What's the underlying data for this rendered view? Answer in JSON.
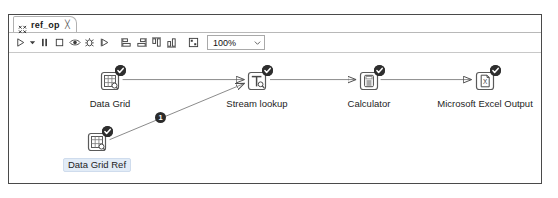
{
  "window": {
    "tab": {
      "label": "ref_op",
      "icon": "transformation-icon",
      "close": "╳"
    }
  },
  "toolbar": {
    "buttons": [
      {
        "name": "run-button",
        "icon": "play-icon",
        "label": "Run"
      },
      {
        "name": "run-options-caret",
        "icon": "caret-down-icon",
        "label": "Run options"
      },
      {
        "name": "pause-button",
        "icon": "pause-icon",
        "label": "Pause"
      },
      {
        "name": "stop-button",
        "icon": "stop-icon",
        "label": "Stop"
      },
      {
        "name": "preview-button",
        "icon": "eye-icon",
        "label": "Preview"
      },
      {
        "name": "debug-button",
        "icon": "bug-icon",
        "label": "Debug"
      },
      {
        "name": "replay-button",
        "icon": "replay-icon",
        "label": "Replay"
      },
      {
        "name": "align-left-button",
        "icon": "align-left-icon",
        "label": "Align left"
      },
      {
        "name": "align-right-button",
        "icon": "align-right-icon",
        "label": "Align right"
      },
      {
        "name": "align-top-button",
        "icon": "align-top-icon",
        "label": "Align top"
      },
      {
        "name": "align-bottom-button",
        "icon": "align-bottom-icon",
        "label": "Align bottom"
      },
      {
        "name": "snap-to-grid-button",
        "icon": "grid-snap-icon",
        "label": "Snap to grid"
      }
    ],
    "zoom": {
      "value": "100%",
      "options": [
        "200%",
        "150%",
        "100%",
        "75%",
        "50%",
        "25%"
      ]
    }
  },
  "canvas": {
    "nodes": [
      {
        "id": "data-grid",
        "label": "Data Grid",
        "icon": "data-grid-icon",
        "x": 101,
        "y": 26,
        "status": "ok",
        "selected": false
      },
      {
        "id": "stream-lookup",
        "label": "Stream lookup",
        "icon": "stream-lookup-icon",
        "x": 248,
        "y": 26,
        "status": "ok",
        "selected": false
      },
      {
        "id": "calculator",
        "label": "Calculator",
        "icon": "calculator-icon",
        "x": 360,
        "y": 26,
        "status": "ok",
        "selected": false
      },
      {
        "id": "microsoft-excel-output",
        "label": "Microsoft Excel Output",
        "icon": "excel-output-icon",
        "x": 476,
        "y": 26,
        "status": "ok",
        "selected": false
      },
      {
        "id": "data-grid-ref",
        "label": "Data Grid Ref",
        "icon": "data-grid-icon",
        "x": 88,
        "y": 88,
        "status": "ok",
        "selected": true
      }
    ],
    "hops": [
      {
        "from": "data-grid",
        "to": "stream-lookup",
        "badge": null
      },
      {
        "from": "data-grid-ref",
        "to": "stream-lookup",
        "badge": "1"
      },
      {
        "from": "stream-lookup",
        "to": "calculator",
        "badge": null
      },
      {
        "from": "calculator",
        "to": "microsoft-excel-output",
        "badge": null
      }
    ],
    "hop_badge_label": "1"
  },
  "colors": {
    "border": "#4a4a4a",
    "icon": "#4a4a4a",
    "badge_ok": "#2e2e2e",
    "selection": "#e2ecf7",
    "hop_line": "#7a7a7a"
  }
}
